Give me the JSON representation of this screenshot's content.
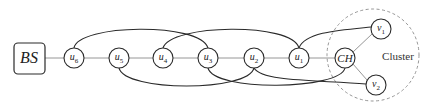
{
  "diagram": {
    "type": "network-topology",
    "colors": {
      "stroke": "#2a2a2a",
      "link": "#8a8a8a",
      "cluster_border": "#8a8a8a",
      "background": "#ffffff"
    },
    "base_station": {
      "id": "BS",
      "label": "BS",
      "x": 29,
      "y": 58
    },
    "nodes": [
      {
        "id": "u6",
        "base": "u",
        "sub": "6",
        "x": 74,
        "y": 58
      },
      {
        "id": "u5",
        "base": "u",
        "sub": "5",
        "x": 119,
        "y": 58
      },
      {
        "id": "u4",
        "base": "u",
        "sub": "4",
        "x": 163,
        "y": 58
      },
      {
        "id": "u3",
        "base": "u",
        "sub": "3",
        "x": 208,
        "y": 58
      },
      {
        "id": "u2",
        "base": "u",
        "sub": "2",
        "x": 254,
        "y": 58
      },
      {
        "id": "u1",
        "base": "u",
        "sub": "1",
        "x": 299,
        "y": 58
      },
      {
        "id": "CH",
        "base": "CH",
        "sub": "",
        "x": 345,
        "y": 58
      },
      {
        "id": "v1",
        "base": "v",
        "sub": "1",
        "x": 381,
        "y": 29
      },
      {
        "id": "v2",
        "base": "v",
        "sub": "2",
        "x": 376,
        "y": 85
      }
    ],
    "chain_links": [
      [
        "BS",
        "u6"
      ],
      [
        "u6",
        "u5"
      ],
      [
        "u5",
        "u4"
      ],
      [
        "u4",
        "u3"
      ],
      [
        "u3",
        "u2"
      ],
      [
        "u2",
        "u1"
      ],
      [
        "u1",
        "CH"
      ],
      [
        "CH",
        "v1"
      ],
      [
        "CH",
        "v2"
      ]
    ],
    "upper_arcs": [
      [
        "u6",
        "u3"
      ],
      [
        "u4",
        "u1"
      ],
      [
        "u1",
        "v1"
      ]
    ],
    "lower_arcs": [
      [
        "u5",
        "u2"
      ],
      [
        "u3",
        "CH"
      ],
      [
        "u2",
        "v2"
      ]
    ],
    "cluster": {
      "label": "Cluster",
      "cx": 373,
      "cy": 55,
      "r": 46,
      "label_x": 398,
      "label_y": 56
    }
  }
}
